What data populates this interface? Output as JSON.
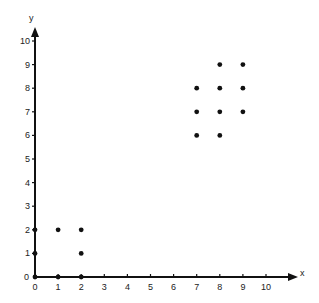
{
  "chart_data": {
    "type": "scatter",
    "title": "",
    "xlabel": "x",
    "ylabel": "y",
    "xlim": [
      0,
      10
    ],
    "ylim": [
      0,
      10
    ],
    "grid": false,
    "legend": null,
    "x_ticks": [
      "0",
      "1",
      "2",
      "3",
      "4",
      "5",
      "6",
      "7",
      "8",
      "9",
      "10"
    ],
    "y_ticks": [
      "0",
      "1",
      "2",
      "3",
      "4",
      "5",
      "6",
      "7",
      "8",
      "9",
      "10"
    ],
    "series": [
      {
        "name": "points",
        "points": [
          {
            "x": 0,
            "y": 0
          },
          {
            "x": 1,
            "y": 0
          },
          {
            "x": 2,
            "y": 0
          },
          {
            "x": 0,
            "y": 1
          },
          {
            "x": 2,
            "y": 1
          },
          {
            "x": 0,
            "y": 2
          },
          {
            "x": 1,
            "y": 2
          },
          {
            "x": 2,
            "y": 2
          },
          {
            "x": 7,
            "y": 6
          },
          {
            "x": 8,
            "y": 6
          },
          {
            "x": 7,
            "y": 7
          },
          {
            "x": 8,
            "y": 7
          },
          {
            "x": 9,
            "y": 7
          },
          {
            "x": 7,
            "y": 8
          },
          {
            "x": 8,
            "y": 8
          },
          {
            "x": 9,
            "y": 8
          },
          {
            "x": 8,
            "y": 9
          },
          {
            "x": 9,
            "y": 9
          }
        ]
      }
    ]
  },
  "axes": {
    "x_name": "x",
    "y_name": "y"
  },
  "colors": {
    "ink": "#111111",
    "background": "#ffffff"
  }
}
